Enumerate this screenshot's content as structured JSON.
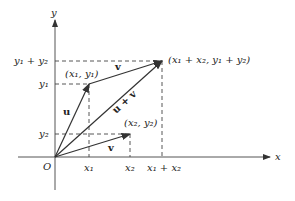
{
  "diagram": {
    "axes": {
      "x_label": "x",
      "y_label": "y",
      "origin_label": "O"
    },
    "x_ticks": [
      "x₁",
      "x₂",
      "x₁ + x₂"
    ],
    "y_ticks": [
      "y₁ + y₂",
      "y₁",
      "y₂"
    ],
    "points": {
      "p1": "(x₁, y₁)",
      "p2": "(x₂, y₂)",
      "sum": "(x₁ + x₂, y₁ + y₂)"
    },
    "vectors": {
      "u": "u",
      "v_top": "v",
      "v_bottom": "v",
      "sum": "u + v"
    },
    "colors": {
      "line": "#333333",
      "dash": "#444444"
    }
  }
}
